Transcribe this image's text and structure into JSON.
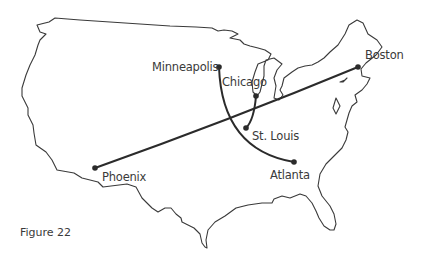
{
  "figure": {
    "caption": "Figure 22",
    "background": "#ffffff",
    "line_color": "#2b2b2b"
  },
  "map": {
    "region": "Continental United States outline",
    "cities": [
      {
        "name": "Minneapolis",
        "x": 219,
        "y": 67
      },
      {
        "name": "Chicago",
        "x": 256,
        "y": 96
      },
      {
        "name": "St. Louis",
        "x": 246,
        "y": 128
      },
      {
        "name": "Atlanta",
        "x": 294,
        "y": 162
      },
      {
        "name": "Boston",
        "x": 358,
        "y": 67
      },
      {
        "name": "Phoenix",
        "x": 95,
        "y": 168
      }
    ],
    "routes": [
      {
        "from": "Phoenix",
        "to": "Boston"
      },
      {
        "from": "Minneapolis",
        "to": "Atlanta"
      },
      {
        "from": "Chicago",
        "to": "St. Louis"
      }
    ]
  }
}
